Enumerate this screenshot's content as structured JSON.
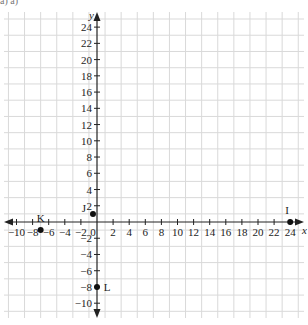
{
  "header": {
    "fragment": "a) a)"
  },
  "chart_data": {
    "type": "scatter",
    "title": "",
    "xlabel": "x",
    "ylabel": "y",
    "xlim": [
      -12,
      25
    ],
    "ylim": [
      -12,
      25
    ],
    "grid": true,
    "x_ticks": [
      -10,
      -8,
      -6,
      -4,
      -2,
      0,
      2,
      4,
      6,
      8,
      10,
      12,
      14,
      16,
      18,
      20,
      22,
      24
    ],
    "y_ticks": [
      -10,
      -8,
      -6,
      -4,
      -2,
      2,
      4,
      6,
      8,
      10,
      12,
      14,
      16,
      18,
      20,
      22,
      24
    ],
    "x_tick_labels": [
      "−10",
      "−8",
      "−6",
      "−4",
      "−2",
      "0",
      "2",
      "4",
      "6",
      "8",
      "10",
      "12",
      "14",
      "16",
      "18",
      "20",
      "22",
      "24"
    ],
    "y_tick_labels": [
      "−10",
      "−8",
      "−6",
      "−4",
      "−2",
      "2",
      "4",
      "6",
      "8",
      "10",
      "12",
      "14",
      "16",
      "18",
      "20",
      "22",
      "24"
    ],
    "points": [
      {
        "label": "I",
        "x": 24,
        "y": 0
      },
      {
        "label": "J",
        "x": -0.5,
        "y": 1
      },
      {
        "label": "K",
        "x": -7,
        "y": -1
      },
      {
        "label": "L",
        "x": 0,
        "y": -8
      }
    ]
  },
  "colors": {
    "grid": "#d9d9d9",
    "axis": "#222222",
    "point": "#111111",
    "text": "#222222"
  }
}
